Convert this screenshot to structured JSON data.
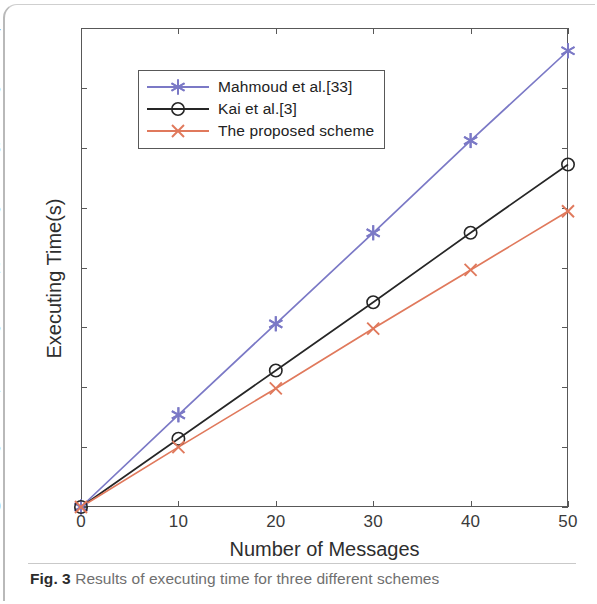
{
  "figure": {
    "caption_label": "Fig. 3",
    "caption_text": " Results of executing time for three different schemes"
  },
  "chart_data": {
    "type": "line",
    "title": "",
    "xlabel": "Number of Messages",
    "ylabel": "Executing Time(s)",
    "xlim": [
      0,
      50
    ],
    "ylim": [
      0,
      4
    ],
    "xticks": [
      0,
      10,
      20,
      30,
      40,
      50
    ],
    "xtick_labels": [
      "0",
      "10",
      "20",
      "30",
      "40",
      "50"
    ],
    "yticks": [
      0,
      0.5,
      1,
      1.5,
      2,
      2.5,
      3,
      3.5,
      4
    ],
    "ytick_labels": [
      "0",
      "0.5",
      "1",
      "1.5",
      "2",
      "2.5",
      "3",
      "3.5",
      "4"
    ],
    "grid": false,
    "legend_position": "upper left inside",
    "x": [
      0,
      10,
      20,
      30,
      40,
      50
    ],
    "series": [
      {
        "name": "Mahmoud et al.[33]",
        "color": "#7b79c6",
        "marker": "star",
        "values": [
          0,
          0.77,
          1.53,
          2.29,
          3.06,
          3.81
        ]
      },
      {
        "name": "Kai et al.[3]",
        "color": "#262626",
        "marker": "circle",
        "values": [
          0,
          0.57,
          1.14,
          1.71,
          2.29,
          2.86
        ]
      },
      {
        "name": "The proposed scheme",
        "color": "#e0795c",
        "marker": "x",
        "values": [
          0,
          0.5,
          0.99,
          1.49,
          1.98,
          2.47
        ]
      }
    ]
  }
}
